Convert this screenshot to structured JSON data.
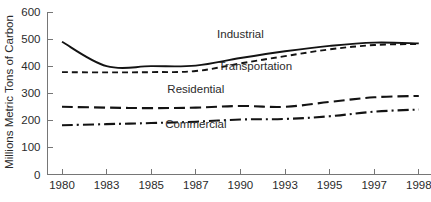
{
  "chart_data": {
    "type": "line",
    "title": "",
    "xlabel": "",
    "ylabel": "Millions Metric Tons of Carbon",
    "ylim": [
      0,
      600
    ],
    "yticks": [
      0,
      100,
      200,
      300,
      400,
      500,
      600
    ],
    "ytick_labels": [
      "0",
      "100",
      "200",
      "300",
      "400",
      "500",
      "600"
    ],
    "x": [
      1980,
      1983,
      1985,
      1987,
      1990,
      1993,
      1995,
      1997,
      1998
    ],
    "xtick_labels": [
      "1980",
      "1983",
      "1985",
      "1987",
      "1990",
      "1993",
      "1995",
      "1997",
      "1998"
    ],
    "grid": false,
    "legend": "inline-annotations",
    "series": [
      {
        "name": "Industrial",
        "style": "solid",
        "values": [
          490,
          400,
          400,
          402,
          430,
          455,
          475,
          487,
          484
        ],
        "label_x": 1990,
        "label_value": 505
      },
      {
        "name": "Transportation",
        "style": "dashed",
        "values": [
          378,
          377,
          378,
          382,
          410,
          437,
          462,
          478,
          482
        ],
        "label_x": 1991,
        "label_value": 385
      },
      {
        "name": "Residential",
        "style": "long-dash",
        "values": [
          250,
          247,
          245,
          247,
          253,
          250,
          268,
          285,
          290
        ],
        "label_x": 1987,
        "label_value": 300
      },
      {
        "name": "Commercial",
        "style": "dash-dot",
        "values": [
          182,
          186,
          190,
          195,
          203,
          205,
          215,
          232,
          240
        ],
        "label_x": 1987,
        "label_value": 170
      }
    ]
  },
  "colors": {
    "line": "#131313",
    "axis": "#767676",
    "text": "#2b2b2b",
    "background": "#ffffff"
  }
}
